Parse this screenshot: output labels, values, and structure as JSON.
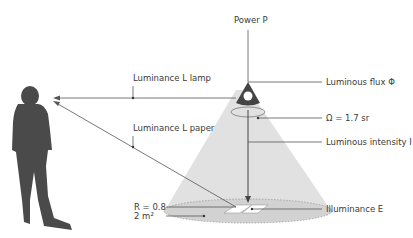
{
  "diagram": {
    "labels": {
      "power": "Power P",
      "luminous_flux": "Luminous flux Φ",
      "solid_angle": "Ω = 1.7 sr",
      "luminous_intensity": "Luminous intensity I",
      "illuminance": "Illuminance E",
      "luminance_lamp": "Luminance L lamp",
      "luminance_paper": "Luminance L  paper",
      "reflectance": "R = 0.8",
      "area": "2 m²"
    },
    "colors": {
      "line": "#555555",
      "figure": "#4a4a4a",
      "cone": "#d9d9d9",
      "lamp": "#444444",
      "paper": "#ffffff"
    }
  }
}
